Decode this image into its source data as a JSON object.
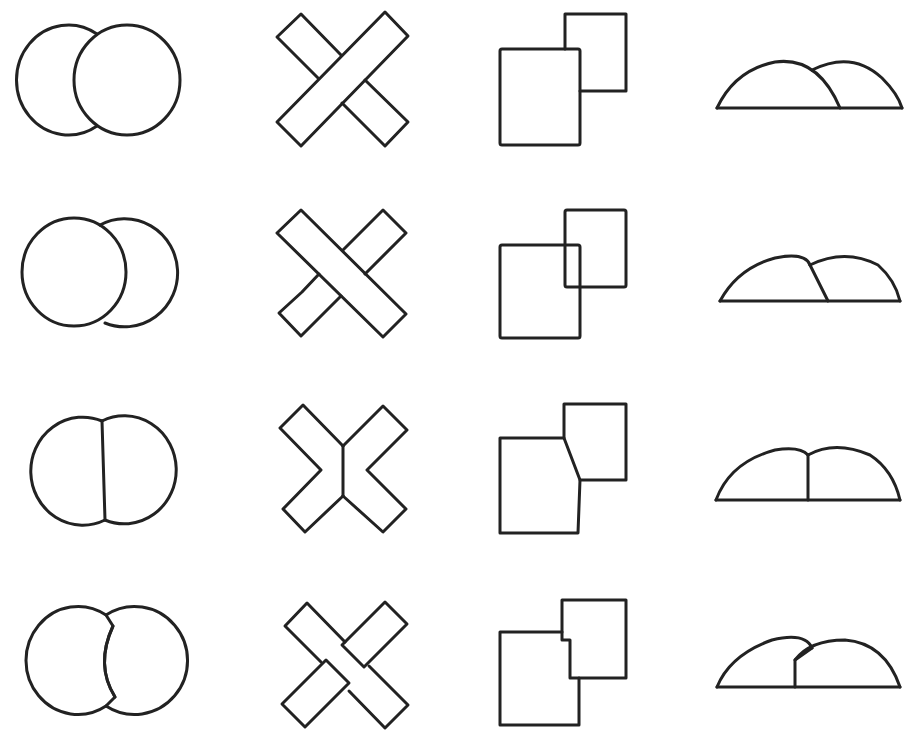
{
  "figure": {
    "type": "occlusion-stimuli-grid",
    "rows": 4,
    "columns": 4,
    "stroke_color": "#222222",
    "background": "#ffffff",
    "column_shapes": [
      "two circles",
      "two crossed bars",
      "two rectangles",
      "two domes"
    ],
    "rows_described": [
      {
        "row": 1,
        "description": "one shape clearly in front, occluding the other"
      },
      {
        "row": 2,
        "description": "reversed or transparent overlap"
      },
      {
        "row": 3,
        "description": "ambiguous shared straight border"
      },
      {
        "row": 4,
        "description": "interlocking / notched contours"
      }
    ],
    "cells": [
      {
        "row": 1,
        "col": 1,
        "label": "circles-overlap-right-front"
      },
      {
        "row": 1,
        "col": 2,
        "label": "bars-cross-ascending-front"
      },
      {
        "row": 1,
        "col": 3,
        "label": "rectangles-lower-left-front"
      },
      {
        "row": 1,
        "col": 4,
        "label": "domes-left-front"
      },
      {
        "row": 2,
        "col": 1,
        "label": "circles-overlap-left-front"
      },
      {
        "row": 2,
        "col": 2,
        "label": "bars-cross-descending-front"
      },
      {
        "row": 2,
        "col": 3,
        "label": "rectangles-transparent-overlap"
      },
      {
        "row": 2,
        "col": 4,
        "label": "domes-slanted-border"
      },
      {
        "row": 3,
        "col": 1,
        "label": "circles-straight-border"
      },
      {
        "row": 3,
        "col": 2,
        "label": "bars-split-vertical-border"
      },
      {
        "row": 3,
        "col": 3,
        "label": "rectangles-slanted-border"
      },
      {
        "row": 3,
        "col": 4,
        "label": "domes-vertical-border"
      },
      {
        "row": 4,
        "col": 1,
        "label": "circles-notched-border"
      },
      {
        "row": 4,
        "col": 2,
        "label": "bars-interlocking"
      },
      {
        "row": 4,
        "col": 3,
        "label": "rectangles-stepped-border"
      },
      {
        "row": 4,
        "col": 4,
        "label": "domes-stepped-border"
      }
    ]
  }
}
